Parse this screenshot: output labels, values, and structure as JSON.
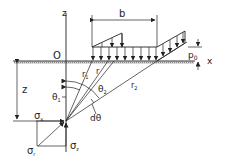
{
  "diagram": {
    "labels": {
      "z_axis": "z",
      "x_axis": "x",
      "origin": "O",
      "width": "b",
      "pressure": "p",
      "pressure_sub": "0",
      "depth": "z",
      "r1": "r",
      "r1_sub": "1",
      "r": "r",
      "r2": "r",
      "r2_sub": "2",
      "theta1": "θ",
      "theta1_sub": "1",
      "theta2": "θ",
      "theta2_sub": "2",
      "dtheta": "dθ",
      "sigma_x": "σ",
      "sigma_x_sub": "x",
      "sigma_z": "σ",
      "sigma_z_sub": "z",
      "sigma_r": "σ",
      "sigma_r_sub": "r"
    },
    "colors": {
      "line": "#222222",
      "hatch": "#999999"
    }
  }
}
